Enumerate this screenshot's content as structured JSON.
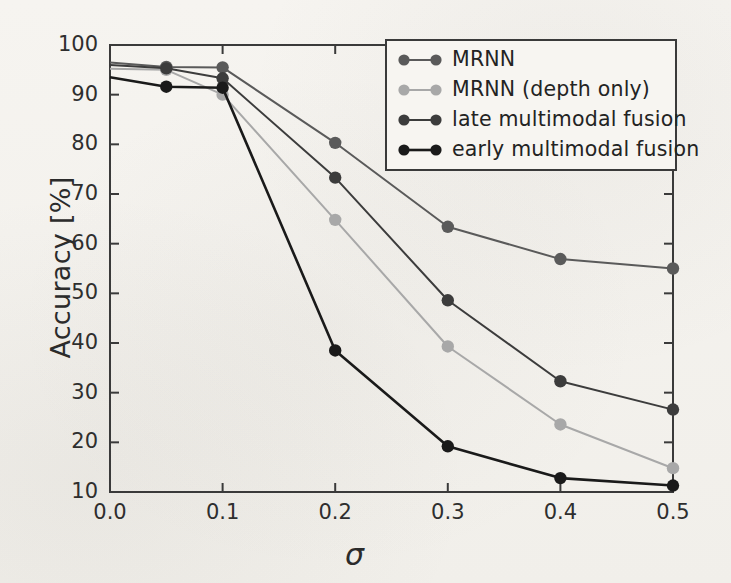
{
  "chart_data": {
    "type": "line",
    "title": "",
    "xlabel": "σ",
    "ylabel": "Accuracy [%]",
    "xlim": [
      0.0,
      0.5
    ],
    "ylim": [
      10,
      100
    ],
    "grid": false,
    "legend_position": "top-right",
    "xticks": [
      "0.0",
      "0.1",
      "0.2",
      "0.3",
      "0.4",
      "0.5"
    ],
    "xtick_values": [
      0.0,
      0.1,
      0.2,
      0.3,
      0.4,
      0.5
    ],
    "yticks": [
      "10",
      "20",
      "30",
      "40",
      "50",
      "60",
      "70",
      "80",
      "90",
      "100"
    ],
    "ytick_values": [
      10,
      20,
      30,
      40,
      50,
      60,
      70,
      80,
      90,
      100
    ],
    "x": [
      0.0,
      0.05,
      0.1,
      0.2,
      0.3,
      0.4,
      0.5
    ],
    "series": [
      {
        "name": "MRNN",
        "color": "#5a5a5a",
        "values": [
          96.5,
          95.6,
          95.5,
          80.3,
          63.4,
          56.9,
          55.0
        ]
      },
      {
        "name": "MRNN (depth only)",
        "color": "#a8a8a8",
        "values": [
          95.2,
          95.0,
          90.0,
          64.8,
          39.3,
          23.6,
          14.8
        ]
      },
      {
        "name": "late multimodal fusion",
        "color": "#3c3c3c",
        "values": [
          96.0,
          95.3,
          93.3,
          73.3,
          48.6,
          32.3,
          26.6
        ]
      },
      {
        "name": "early multimodal fusion",
        "color": "#1a1a1a",
        "values": [
          93.5,
          91.6,
          91.4,
          38.5,
          19.2,
          12.8,
          11.3
        ]
      }
    ]
  },
  "legend": {
    "entries": [
      {
        "label": "MRNN"
      },
      {
        "label": "MRNN (depth only)"
      },
      {
        "label": "late multimodal fusion"
      },
      {
        "label": "early multimodal fusion"
      }
    ]
  }
}
